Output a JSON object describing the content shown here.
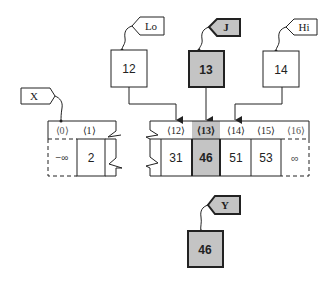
{
  "colors": {
    "line": "#222222",
    "highlight_fill": "#c4c4c4",
    "box_fill": "#ffffff"
  },
  "tags": {
    "lo": "Lo",
    "j": "J",
    "hi": "Hi",
    "x": "X",
    "y": "Y"
  },
  "variables": {
    "lo_value": "12",
    "j_value": "13",
    "hi_value": "14",
    "y_value": "46"
  },
  "array_x": {
    "indices": [
      "⟨0⟩",
      "⟨1⟩"
    ],
    "values": [
      "−∞",
      "2"
    ]
  },
  "array_segment": {
    "indices": [
      "⟨12⟩",
      "⟨13⟩",
      "⟨14⟩",
      "⟨15⟩",
      "⟨16⟩"
    ],
    "values": [
      "31",
      "46",
      "51",
      "53",
      "∞"
    ],
    "highlighted_index": 1
  }
}
